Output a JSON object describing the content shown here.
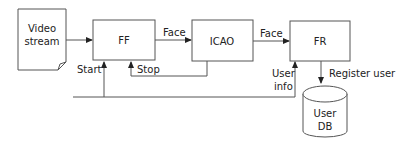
{
  "diagram": {
    "nodes": {
      "video_stream": {
        "line1": "Video",
        "line2": "stream"
      },
      "ff": {
        "label": "FF"
      },
      "icao": {
        "label": "ICAO"
      },
      "fr": {
        "label": "FR"
      },
      "user_db": {
        "line1": "User",
        "line2": "DB"
      }
    },
    "edges": {
      "ff_to_icao": {
        "label": "Face"
      },
      "icao_to_fr": {
        "label": "Face"
      },
      "start": {
        "label": "Start"
      },
      "stop": {
        "label": "Stop"
      },
      "user_info": {
        "line1": "User",
        "line2": "info"
      },
      "register_user": {
        "label": "Register user"
      }
    },
    "colors": {
      "stroke": "#555555",
      "text": "#222222",
      "background": "#ffffff"
    }
  }
}
